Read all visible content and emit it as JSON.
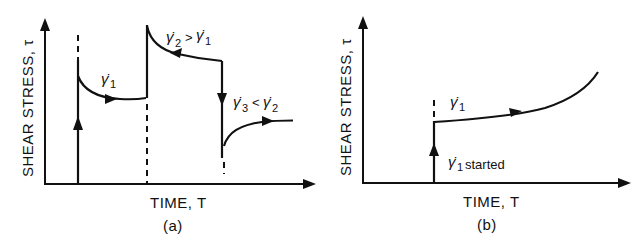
{
  "figure": {
    "panels": [
      {
        "id": "a",
        "caption": "(a)",
        "ylabel": "SHEAR STRESS, τ",
        "xlabel": "TIME, T",
        "annotations": {
          "seg1": {
            "sym": "γ̇",
            "sub": "1"
          },
          "seg2": {
            "sym": "γ̇",
            "sub": "2",
            "rel": ">",
            "sym2": "γ̇",
            "sub2": "1"
          },
          "seg3": {
            "sym": "γ̇",
            "sub": "3",
            "rel": "<",
            "sym2": "γ̇",
            "sub2": "2"
          }
        },
        "description": "Thixotropic response: stress jumps then decays under γ̇1; step up to γ̇2 > γ̇1 produces overshoot and decay; step down to γ̇3 < γ̇2 produces undershoot and recovery."
      },
      {
        "id": "b",
        "caption": "(b)",
        "ylabel": "SHEAR STRESS, τ",
        "xlabel": "TIME, T",
        "annotations": {
          "seg1": {
            "sym": "γ̇",
            "sub": "1"
          },
          "start": {
            "sym": "γ̇",
            "sub": "1",
            "text": "started"
          }
        },
        "description": "Rheopectic response: stress jumps when γ̇1 is started then rises continuously with time."
      }
    ]
  },
  "colors": {
    "ink": "#111111",
    "background": "#ffffff"
  }
}
